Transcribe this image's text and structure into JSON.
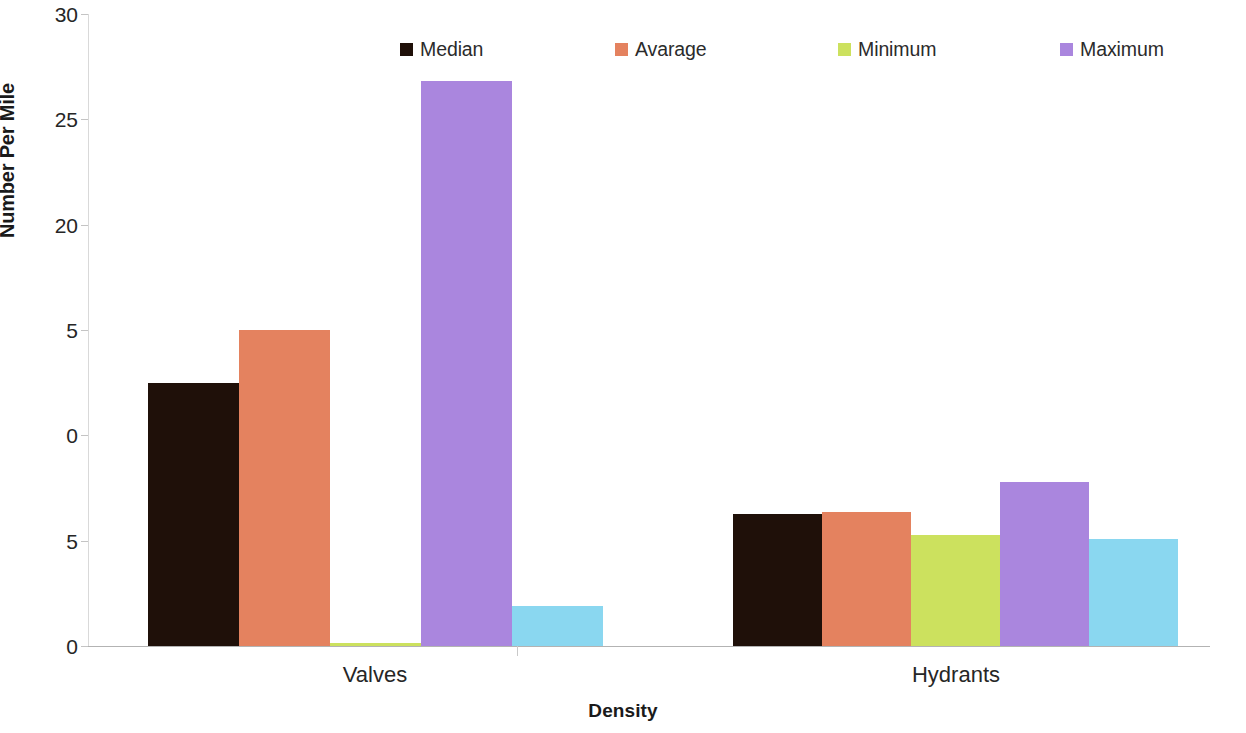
{
  "chart_data": {
    "type": "bar",
    "title": "",
    "subtitle": "",
    "xlabel": "Density",
    "ylabel": "Number Per Mile",
    "categories": [
      "Valves",
      "Hydrants"
    ],
    "series": [
      {
        "name": "Median",
        "color": "#1F1009",
        "values": [
          12.5,
          6.25
        ]
      },
      {
        "name": "Avarage",
        "color": "#E4825F",
        "values": [
          15.0,
          6.35
        ]
      },
      {
        "name": "Minimum",
        "color": "#CCE15E",
        "values": [
          0.15,
          5.25
        ]
      },
      {
        "name": "Maximum",
        "color": "#AA86DE",
        "values": [
          26.8,
          7.8
        ]
      },
      {
        "name": "Value  in Tabriz",
        "color": "#8AD7F0",
        "values": [
          1.9,
          5.1
        ]
      }
    ],
    "ylim": [
      0,
      30
    ],
    "ytick_values": [
      0,
      5,
      10,
      15,
      20,
      25,
      30
    ],
    "ytick_labels": [
      "0",
      "5",
      "10",
      "15",
      "20",
      "25",
      "30"
    ],
    "ytick_labels_rendered": [
      "0",
      "5",
      "0",
      "5",
      "20",
      "25",
      "30"
    ],
    "grid": false,
    "legend_position": "top",
    "legend": [
      {
        "label": "Median",
        "swatch_color": "#1F1009",
        "icon": "legend-swatch-icon"
      },
      {
        "label": "Avarage",
        "swatch_color": "#E4825F",
        "icon": "legend-swatch-icon"
      },
      {
        "label": "Minimum",
        "swatch_color": "#CCE15E",
        "icon": "legend-swatch-icon"
      },
      {
        "label": "Maximum",
        "swatch_color": "#AA86DE",
        "icon": "legend-swatch-icon"
      },
      {
        "label": "Value  in Tabriz",
        "swatch_color": "#8AD7F0",
        "icon": "legend-swatch-icon"
      }
    ],
    "axis_colors": {
      "value_axis_line": "#d9d9d9",
      "category_axis_line": "#b3b3b3",
      "tick_mark": "#c4c4c4",
      "text": "#262626"
    }
  }
}
